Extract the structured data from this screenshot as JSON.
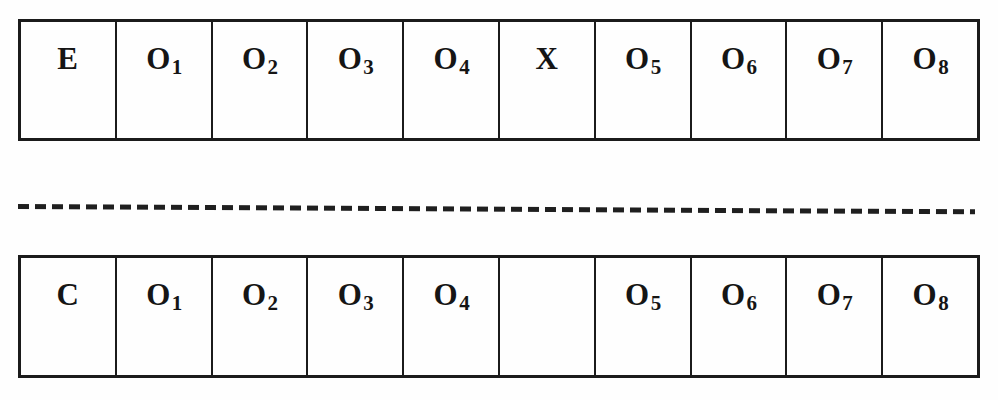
{
  "diagram": {
    "type": "experimental-design-notation",
    "background_color": "#fefefe",
    "ink_color": "#1b1b1b",
    "rows": [
      {
        "id": "experimental",
        "name": "experimental-group-row",
        "cells": [
          {
            "base": "E",
            "sub": "",
            "empty": false
          },
          {
            "base": "O",
            "sub": "1",
            "empty": false
          },
          {
            "base": "O",
            "sub": "2",
            "empty": false
          },
          {
            "base": "O",
            "sub": "3",
            "empty": false
          },
          {
            "base": "O",
            "sub": "4",
            "empty": false
          },
          {
            "base": "X",
            "sub": "",
            "empty": false
          },
          {
            "base": "O",
            "sub": "5",
            "empty": false
          },
          {
            "base": "O",
            "sub": "6",
            "empty": false
          },
          {
            "base": "O",
            "sub": "7",
            "empty": false
          },
          {
            "base": "O",
            "sub": "8",
            "empty": false
          }
        ]
      },
      {
        "id": "control",
        "name": "control-group-row",
        "cells": [
          {
            "base": "C",
            "sub": "",
            "empty": false
          },
          {
            "base": "O",
            "sub": "1",
            "empty": false
          },
          {
            "base": "O",
            "sub": "2",
            "empty": false
          },
          {
            "base": "O",
            "sub": "3",
            "empty": false
          },
          {
            "base": "O",
            "sub": "4",
            "empty": false
          },
          {
            "base": "",
            "sub": "",
            "empty": true
          },
          {
            "base": "O",
            "sub": "5",
            "empty": false
          },
          {
            "base": "O",
            "sub": "6",
            "empty": false
          },
          {
            "base": "O",
            "sub": "7",
            "empty": false
          },
          {
            "base": "O",
            "sub": "8",
            "empty": false
          }
        ]
      }
    ],
    "separator": {
      "name": "dashed-divider",
      "style": "dashed"
    }
  }
}
